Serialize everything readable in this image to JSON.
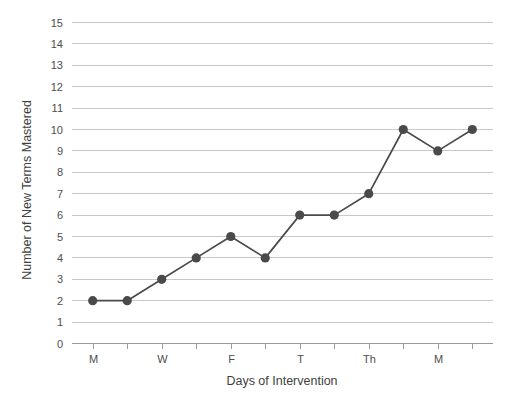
{
  "chart_data": {
    "type": "line",
    "title": "",
    "xlabel": "Days of Intervention",
    "ylabel": "Number of New Terms Mastered",
    "x": [
      1,
      2,
      3,
      4,
      5,
      6,
      7,
      8,
      9,
      10,
      11,
      12
    ],
    "values": [
      2,
      2,
      3,
      4,
      5,
      4,
      6,
      6,
      7,
      10,
      9,
      10
    ],
    "series": [
      {
        "name": "New Terms Mastered",
        "values": [
          2,
          2,
          3,
          4,
          5,
          4,
          6,
          6,
          7,
          10,
          9,
          10
        ]
      }
    ],
    "x_tick_positions": [
      1,
      2,
      3,
      4,
      5,
      6,
      7,
      8,
      9,
      10,
      11,
      12
    ],
    "x_tick_labels": [
      "M",
      "",
      "W",
      "",
      "F",
      "",
      "T",
      "",
      "Th",
      "",
      "M",
      ""
    ],
    "y_ticks": [
      0,
      1,
      2,
      3,
      4,
      5,
      6,
      7,
      8,
      9,
      10,
      11,
      12,
      13,
      14,
      15
    ],
    "y_tick_labels": [
      "0",
      "1",
      "2",
      "3",
      "4",
      "5",
      "6",
      "7",
      "8",
      "9",
      "10",
      "11",
      "12",
      "13",
      "14",
      "15"
    ],
    "ylim": [
      0,
      15
    ],
    "xlim": [
      0.4,
      12.6
    ],
    "grid": true,
    "grid_axis": "y",
    "legend": false,
    "legend_position": "none",
    "marker": "circle",
    "colors": {
      "line": "#4a4a4a",
      "marker": "#4a4a4a",
      "gridline": "#c9c9c9",
      "axis": "#9a9a9a",
      "text": "#4d4d4d",
      "background": "#ffffff"
    }
  }
}
